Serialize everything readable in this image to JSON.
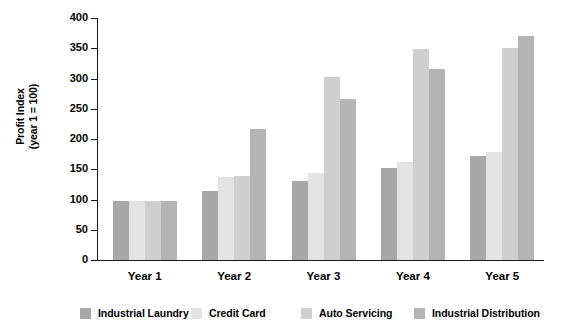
{
  "chart_data": {
    "type": "bar",
    "title": "",
    "subtitle": "",
    "xlabel": "",
    "ylabel": "Profit Index\n(year 1 = 100)",
    "ylim": [
      0,
      400
    ],
    "yticks": [
      0,
      50,
      100,
      150,
      200,
      250,
      300,
      350,
      400
    ],
    "ytick_labels": [
      "0",
      "50",
      "100",
      "150",
      "200",
      "250",
      "300",
      "350",
      "400"
    ],
    "grid": false,
    "legend_position": "bottom",
    "categories": [
      "Year 1",
      "Year 2",
      "Year 3",
      "Year 4",
      "Year 5"
    ],
    "series": [
      {
        "name": "Industrial Laundry",
        "color": "#a8a8a8",
        "values": [
          97,
          114,
          131,
          152,
          172
        ]
      },
      {
        "name": "Credit Card",
        "color": "#e3e3e3",
        "values": [
          97,
          137,
          144,
          162,
          178
        ]
      },
      {
        "name": "Auto Servicing",
        "color": "#cfcfcf",
        "values": [
          97,
          139,
          302,
          348,
          351
        ]
      },
      {
        "name": "Industrial Distribution",
        "color": "#b4b4b4",
        "values": [
          97,
          216,
          266,
          315,
          370
        ]
      }
    ]
  },
  "legend": {
    "items": [
      {
        "label": "Industrial Laundry",
        "color": "#a8a8a8"
      },
      {
        "label": "Credit Card",
        "color": "#e3e3e3"
      },
      {
        "label": "Auto Servicing",
        "color": "#cfcfcf"
      },
      {
        "label": "Industrial Distribution",
        "color": "#b4b4b4"
      }
    ]
  },
  "axes": {
    "y_title": "Profit Index\n(year 1 = 100)",
    "axis_color": "#1a1a1a"
  }
}
